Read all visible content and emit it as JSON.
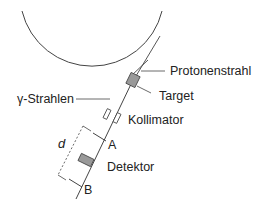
{
  "diagram": {
    "labels": {
      "proton_beam": "Protonenstrahl",
      "target": "Target",
      "gamma_rays": "γ-Strahlen",
      "collimator": "Kollimator",
      "point_a": "A",
      "point_b": "B",
      "detector": "Detektor",
      "distance": "d"
    },
    "colors": {
      "line": "#333333",
      "fill_gray": "#999999",
      "text": "#222222"
    }
  }
}
